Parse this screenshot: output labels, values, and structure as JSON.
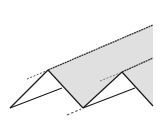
{
  "diagram": {
    "type": "folded-plate-zigzag",
    "width": 162,
    "height": 136,
    "colors": {
      "background": "#ffffff",
      "fill": "#e0e0e0",
      "line": "#1a1a1a",
      "dash": "#555555"
    },
    "vertices": {
      "left_base": [
        10,
        108
      ],
      "peak1": [
        48,
        70
      ],
      "valley": [
        83,
        108
      ],
      "peak2": [
        122,
        72
      ],
      "right_base": [
        153,
        106
      ],
      "top_right": [
        153,
        25
      ],
      "mid_right": [
        153,
        58
      ],
      "inner1": [
        62,
        88
      ],
      "inner2": [
        135,
        88
      ]
    },
    "shaded_faces": 2,
    "dashed_extensions": 3
  }
}
